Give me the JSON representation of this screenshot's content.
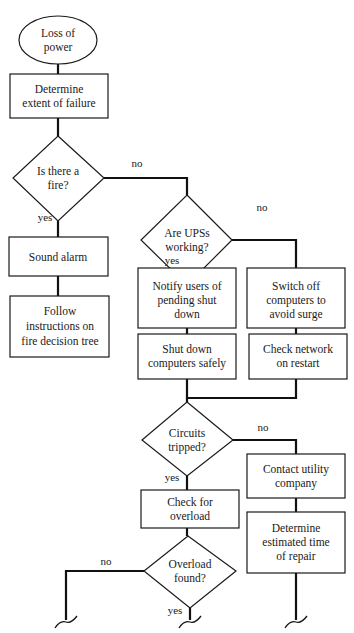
{
  "diagram": {
    "type": "flowchart",
    "nodes": {
      "start": {
        "shape": "ellipse",
        "lines": [
          "Loss of",
          "power"
        ]
      },
      "determine_extent": {
        "shape": "rect",
        "lines": [
          "Determine",
          "extent of failure"
        ]
      },
      "is_fire": {
        "shape": "diamond",
        "lines": [
          "Is there a",
          "fire?"
        ]
      },
      "sound_alarm": {
        "shape": "rect",
        "lines": [
          "Sound alarm"
        ]
      },
      "follow_instructions": {
        "shape": "rect",
        "lines": [
          "Follow",
          "instructions on",
          "fire decision tree"
        ]
      },
      "ups_working": {
        "shape": "diamond",
        "lines": [
          "Are UPSs",
          "working?"
        ]
      },
      "notify_users": {
        "shape": "rect",
        "lines": [
          "Notify users of",
          "pending shut",
          "down"
        ]
      },
      "shut_down": {
        "shape": "rect",
        "lines": [
          "Shut down",
          "computers safely"
        ]
      },
      "switch_off": {
        "shape": "rect",
        "lines": [
          "Switch off",
          "computers to",
          "avoid surge"
        ]
      },
      "check_network": {
        "shape": "rect",
        "lines": [
          "Check network",
          "on restart"
        ]
      },
      "circuits_tripped": {
        "shape": "diamond",
        "lines": [
          "Circuits",
          "tripped?"
        ]
      },
      "check_overload": {
        "shape": "rect",
        "lines": [
          "Check for",
          "overload"
        ]
      },
      "overload_found": {
        "shape": "diamond",
        "lines": [
          "Overload",
          "found?"
        ]
      },
      "contact_utility": {
        "shape": "rect",
        "lines": [
          "Contact utility",
          "company"
        ]
      },
      "estimate_repair": {
        "shape": "rect",
        "lines": [
          "Determine",
          "estimated time",
          "of repair"
        ]
      }
    },
    "edge_labels": {
      "fire_no": "no",
      "fire_yes": "yes",
      "ups_no": "no",
      "ups_yes": "yes",
      "circuits_no": "no",
      "circuits_yes": "yes",
      "overload_no": "no",
      "overload_yes": "yes"
    },
    "edges": [
      {
        "from": "start",
        "to": "determine_extent"
      },
      {
        "from": "determine_extent",
        "to": "is_fire"
      },
      {
        "from": "is_fire",
        "to": "sound_alarm",
        "label": "yes"
      },
      {
        "from": "sound_alarm",
        "to": "follow_instructions"
      },
      {
        "from": "is_fire",
        "to": "ups_working",
        "label": "no"
      },
      {
        "from": "ups_working",
        "to": "notify_users",
        "label": "yes"
      },
      {
        "from": "notify_users",
        "to": "shut_down"
      },
      {
        "from": "ups_working",
        "to": "switch_off",
        "label": "no"
      },
      {
        "from": "switch_off",
        "to": "check_network"
      },
      {
        "from": "shut_down",
        "to": "circuits_tripped"
      },
      {
        "from": "check_network",
        "to": "circuits_tripped"
      },
      {
        "from": "circuits_tripped",
        "to": "check_overload",
        "label": "yes"
      },
      {
        "from": "circuits_tripped",
        "to": "contact_utility",
        "label": "no"
      },
      {
        "from": "check_overload",
        "to": "overload_found"
      },
      {
        "from": "contact_utility",
        "to": "estimate_repair"
      },
      {
        "from": "overload_found",
        "to": "continues-off-page",
        "label": "no"
      },
      {
        "from": "overload_found",
        "to": "continues-off-page",
        "label": "yes"
      },
      {
        "from": "estimate_repair",
        "to": "continues-off-page"
      }
    ]
  }
}
